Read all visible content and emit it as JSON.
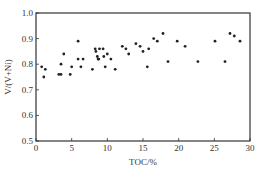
{
  "chart_data": {
    "type": "scatter",
    "title": "",
    "xlabel": "TOC/%",
    "ylabel": "V/(V+Ni)",
    "xlim": [
      0,
      30
    ],
    "ylim": [
      0.5,
      1.0
    ],
    "xticks": [
      0,
      5,
      10,
      15,
      20,
      25,
      30
    ],
    "yticks": [
      0.5,
      0.6,
      0.7,
      0.8,
      0.9,
      1.0
    ],
    "xtick_labels": [
      "0",
      "5",
      "10",
      "15",
      "20",
      "25",
      "30"
    ],
    "ytick_labels": [
      "0.5",
      "0.6",
      "0.7",
      "0.8",
      "0.9",
      "1.0"
    ],
    "grid": false,
    "legend": null,
    "marker_color": "#222222",
    "series": [
      {
        "name": "samples",
        "points": [
          [
            0.8,
            0.79
          ],
          [
            1.3,
            0.78
          ],
          [
            1.1,
            0.75
          ],
          [
            3.2,
            0.76
          ],
          [
            3.5,
            0.76
          ],
          [
            3.5,
            0.8
          ],
          [
            3.9,
            0.84
          ],
          [
            4.8,
            0.76
          ],
          [
            5.0,
            0.79
          ],
          [
            5.9,
            0.82
          ],
          [
            5.9,
            0.89
          ],
          [
            6.3,
            0.79
          ],
          [
            6.6,
            0.82
          ],
          [
            7.9,
            0.78
          ],
          [
            8.3,
            0.86
          ],
          [
            8.4,
            0.85
          ],
          [
            8.6,
            0.83
          ],
          [
            8.7,
            0.82
          ],
          [
            8.8,
            0.82
          ],
          [
            8.9,
            0.86
          ],
          [
            9.4,
            0.86
          ],
          [
            9.5,
            0.83
          ],
          [
            9.7,
            0.79
          ],
          [
            10.0,
            0.84
          ],
          [
            10.5,
            0.82
          ],
          [
            11.1,
            0.78
          ],
          [
            12.1,
            0.87
          ],
          [
            12.6,
            0.86
          ],
          [
            13.0,
            0.84
          ],
          [
            14.0,
            0.88
          ],
          [
            14.6,
            0.87
          ],
          [
            15.0,
            0.85
          ],
          [
            15.6,
            0.79
          ],
          [
            15.8,
            0.86
          ],
          [
            16.5,
            0.9
          ],
          [
            17.0,
            0.89
          ],
          [
            17.8,
            0.92
          ],
          [
            18.5,
            0.81
          ],
          [
            19.8,
            0.89
          ],
          [
            20.9,
            0.87
          ],
          [
            22.7,
            0.81
          ],
          [
            25.1,
            0.89
          ],
          [
            26.5,
            0.81
          ],
          [
            27.2,
            0.92
          ],
          [
            27.8,
            0.91
          ],
          [
            28.6,
            0.89
          ]
        ]
      }
    ]
  }
}
